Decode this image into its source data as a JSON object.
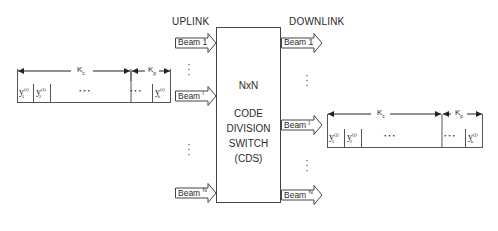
{
  "labels": {
    "uplink": "UPLINK",
    "downlink": "DOWNLINK"
  },
  "switch": {
    "line1": "NxN",
    "line2": "CODE",
    "line3": "DIVISION",
    "line4": "SWITCH",
    "line5": "(CDS)"
  },
  "uplink_beams": [
    {
      "label": "Beam",
      "index": "1"
    },
    {
      "label": "Beam",
      "index": "i"
    },
    {
      "label": "Beam",
      "index": "N"
    }
  ],
  "downlink_beams": [
    {
      "label": "Beam",
      "index": "1"
    },
    {
      "label": "Beam",
      "index": "j"
    },
    {
      "label": "Beam",
      "index": "N"
    }
  ],
  "uplink_frame": {
    "kc": "K",
    "kc_sub": "c",
    "kp": "K",
    "kp_sub": "p",
    "cell1": "y",
    "cell1_sup": "(i)",
    "cell1_sub": "1",
    "cell2": "y",
    "cell2_sup": "(i)",
    "cell2_sub": "2",
    "ellipsis": "• • •",
    "celllast": "y",
    "celllast_sup": "(i)",
    "celllast_sub": "k"
  },
  "downlink_frame": {
    "kc": "K",
    "kc_sub": "c",
    "kp": "K",
    "kp_sub": "p",
    "cell1": "y",
    "cell1_sup": "(j)",
    "cell1_sub": "1",
    "cell2": "y",
    "cell2_sup": "(j)",
    "cell2_sub": "2",
    "ellipsis": "• • •",
    "celllast": "y",
    "celllast_sup": "(j)",
    "celllast_sub": "k"
  }
}
